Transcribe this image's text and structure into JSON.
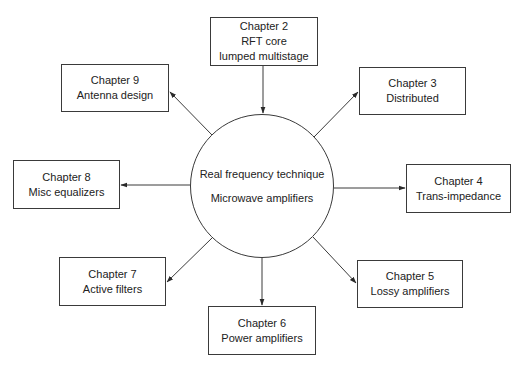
{
  "center": {
    "line1": "Real frequency technique",
    "line2": "Microwave amplifiers"
  },
  "chapters": [
    {
      "id": "ch2",
      "title": "Chapter 2",
      "lines": [
        "RFT core",
        "lumped multistage"
      ]
    },
    {
      "id": "ch3",
      "title": "Chapter 3",
      "lines": [
        "Distributed"
      ]
    },
    {
      "id": "ch4",
      "title": "Chapter 4",
      "lines": [
        "Trans-impedance"
      ]
    },
    {
      "id": "ch5",
      "title": "Chapter 5",
      "lines": [
        "Lossy amplifiers"
      ]
    },
    {
      "id": "ch6",
      "title": "Chapter 6",
      "lines": [
        "Power amplifiers"
      ]
    },
    {
      "id": "ch7",
      "title": "Chapter 7",
      "lines": [
        "Active filters"
      ]
    },
    {
      "id": "ch8",
      "title": "Chapter 8",
      "lines": [
        "Misc equalizers"
      ]
    },
    {
      "id": "ch9",
      "title": "Chapter 9",
      "lines": [
        "Antenna design"
      ]
    }
  ],
  "edges": [
    {
      "from": "ch2",
      "to": "center",
      "direction": "into-center"
    },
    {
      "from": "center",
      "to": "ch3"
    },
    {
      "from": "center",
      "to": "ch4"
    },
    {
      "from": "center",
      "to": "ch5"
    },
    {
      "from": "center",
      "to": "ch6"
    },
    {
      "from": "center",
      "to": "ch7"
    },
    {
      "from": "center",
      "to": "ch8"
    },
    {
      "from": "center",
      "to": "ch9"
    }
  ],
  "colors": {
    "stroke": "#3a3a3a",
    "text": "#222222",
    "background": "#ffffff"
  }
}
